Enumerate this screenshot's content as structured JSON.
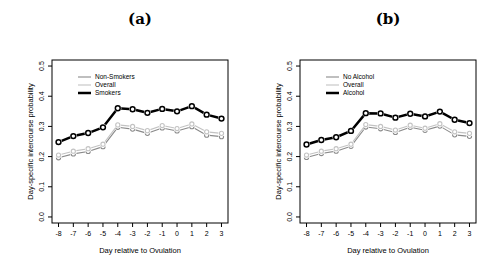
{
  "figure": {
    "background": "#ffffff",
    "axis_color": "#000000",
    "text_color": "#000000"
  },
  "chart_data": [
    {
      "type": "line",
      "title": "(a)",
      "xlabel": "Day relative to Ovulation",
      "ylabel": "Day-specific intercourse probability",
      "x": [
        -8,
        -7,
        -6,
        -5,
        -4,
        -3,
        -2,
        -1,
        0,
        1,
        2,
        3
      ],
      "xtick_labels": [
        "-8",
        "-7",
        "-6",
        "-5",
        "-4",
        "-3",
        "-2",
        "-1",
        "0",
        "1",
        "2",
        "3"
      ],
      "yticks": [
        0,
        0.1,
        0.2,
        0.3,
        0.4,
        0.5
      ],
      "ytick_labels": [
        "0.0",
        "0.1",
        "0.2",
        "0.3",
        "0.4",
        "0.5"
      ],
      "xlim": [
        -8,
        3
      ],
      "ylim": [
        0,
        0.5
      ],
      "grid": false,
      "legend_position": "top-left",
      "series": [
        {
          "name": "Non-Smokers",
          "color": "#8a8a8a",
          "line_width": 1.1,
          "marker": "open-circle",
          "values": [
            0.196,
            0.209,
            0.217,
            0.233,
            0.297,
            0.291,
            0.277,
            0.295,
            0.285,
            0.299,
            0.271,
            0.266
          ]
        },
        {
          "name": "Overall",
          "color": "#c3c3c3",
          "line_width": 1.1,
          "marker": "open-circle",
          "values": [
            0.205,
            0.218,
            0.226,
            0.241,
            0.305,
            0.3,
            0.286,
            0.303,
            0.293,
            0.308,
            0.282,
            0.277
          ]
        },
        {
          "name": "Smokers",
          "color": "#000000",
          "line_width": 2.5,
          "marker": "open-circle",
          "values": [
            0.248,
            0.268,
            0.278,
            0.297,
            0.36,
            0.357,
            0.345,
            0.358,
            0.35,
            0.367,
            0.339,
            0.326
          ]
        }
      ]
    },
    {
      "type": "line",
      "title": "(b)",
      "xlabel": "Day relative to Ovulation",
      "ylabel": "Day-specific intercourse probability",
      "x": [
        -8,
        -7,
        -6,
        -5,
        -4,
        -3,
        -2,
        -1,
        0,
        1,
        2,
        3
      ],
      "xtick_labels": [
        "-8",
        "-7",
        "-6",
        "-5",
        "-4",
        "-3",
        "-2",
        "-1",
        "0",
        "1",
        "2",
        "3"
      ],
      "yticks": [
        0,
        0.1,
        0.2,
        0.3,
        0.4,
        0.5
      ],
      "ytick_labels": [
        "0.0",
        "0.1",
        "0.2",
        "0.3",
        "0.4",
        "0.5"
      ],
      "xlim": [
        -8,
        3
      ],
      "ylim": [
        0,
        0.5
      ],
      "grid": false,
      "legend_position": "top-left",
      "series": [
        {
          "name": "No Alcohol",
          "color": "#8a8a8a",
          "line_width": 1.1,
          "marker": "open-circle",
          "values": [
            0.197,
            0.21,
            0.218,
            0.234,
            0.298,
            0.292,
            0.28,
            0.297,
            0.287,
            0.301,
            0.272,
            0.267
          ]
        },
        {
          "name": "Overall",
          "color": "#c3c3c3",
          "line_width": 1.1,
          "marker": "open-circle",
          "values": [
            0.205,
            0.218,
            0.226,
            0.241,
            0.306,
            0.3,
            0.288,
            0.304,
            0.294,
            0.309,
            0.282,
            0.277
          ]
        },
        {
          "name": "Alcohol",
          "color": "#000000",
          "line_width": 2.5,
          "marker": "open-circle",
          "values": [
            0.24,
            0.255,
            0.264,
            0.285,
            0.344,
            0.343,
            0.329,
            0.342,
            0.333,
            0.349,
            0.322,
            0.311
          ]
        }
      ]
    }
  ]
}
